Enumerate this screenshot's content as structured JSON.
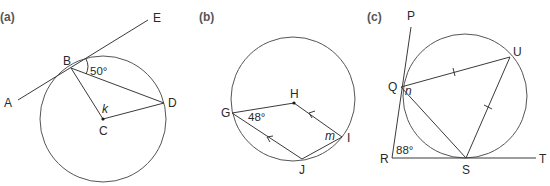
{
  "header_fragment": "State the angles ... g ... g",
  "panels": [
    {
      "label": "(a)",
      "points": {
        "A": "A",
        "B": "B",
        "C": "C",
        "D": "D",
        "E": "E"
      },
      "angle_label": "50°",
      "unknown": "k",
      "description": "Tangent AE touches circle at B; C is centre; chords BD, radii CB and CD"
    },
    {
      "label": "(b)",
      "points": {
        "G": "G",
        "H": "H",
        "I": "I",
        "J": "J"
      },
      "angle_label": "48°",
      "unknown": "m",
      "description": "H is centre; GH, HI, GJ, JI; HI parallel to GJ (arrows)"
    },
    {
      "label": "(c)",
      "points": {
        "P": "P",
        "Q": "Q",
        "R": "R",
        "S": "S",
        "T": "T",
        "U": "U"
      },
      "angle_label": "88°",
      "unknown": "n",
      "description": "RP tangent at Q, RT tangent at S; QU = US (tick marks); chord QS"
    }
  ],
  "colors": {
    "line": "#3a3a3a",
    "circle": "#555555",
    "text": "#2a2a2a"
  }
}
